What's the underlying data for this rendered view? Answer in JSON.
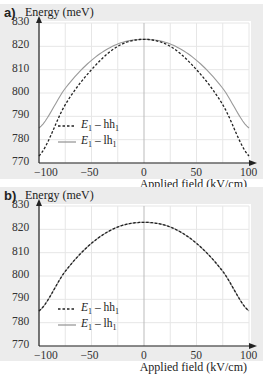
{
  "chart_data": [
    {
      "panel": "a)",
      "type": "line",
      "title": "",
      "ylabel": "Energy (meV)",
      "xlabel": "Applied field (kV/cm)",
      "xlim": [
        -100,
        100
      ],
      "ylim": [
        770,
        830
      ],
      "xticks": [
        "-100",
        "-50",
        "0",
        "50",
        "100"
      ],
      "yticks": [
        "830",
        "820",
        "810",
        "800",
        "790",
        "780",
        "770"
      ],
      "grid": true,
      "legend_position": "lower-left inside",
      "x": [
        -100,
        -75,
        -50,
        -25,
        0,
        25,
        50,
        75,
        100
      ],
      "series": [
        {
          "name": "E1 – hh1",
          "style": "dashed",
          "color": "#222222",
          "values": [
            773,
            795,
            810,
            820,
            823,
            820,
            810,
            795,
            773
          ]
        },
        {
          "name": "E1 – lh1",
          "style": "solid",
          "color": "#999999",
          "values": [
            785,
            802,
            814,
            821,
            823,
            821,
            814,
            802,
            785
          ]
        }
      ]
    },
    {
      "panel": "b)",
      "type": "line",
      "title": "",
      "ylabel": "Energy (meV)",
      "xlabel": "Applied field (kV/cm)",
      "xlim": [
        -100,
        100
      ],
      "ylim": [
        770,
        830
      ],
      "xticks": [
        "-100",
        "-50",
        "0",
        "50",
        "100"
      ],
      "yticks": [
        "830",
        "820",
        "810",
        "800",
        "790",
        "780",
        "770"
      ],
      "grid": true,
      "legend_position": "lower-left inside",
      "x": [
        -100,
        -75,
        -50,
        -25,
        0,
        25,
        50,
        75,
        100
      ],
      "series": [
        {
          "name": "E1 – hh1",
          "style": "dashed",
          "color": "#222222",
          "values": [
            785,
            802,
            814,
            821,
            823,
            821,
            814,
            802,
            785
          ]
        },
        {
          "name": "E1 – lh1",
          "style": "solid",
          "color": "#999999",
          "values": [
            785,
            802,
            814,
            821,
            823,
            821,
            814,
            802,
            785
          ]
        }
      ]
    }
  ],
  "panels": [
    {
      "label": "a)",
      "ylabel": "Energy (meV)",
      "xlabel": "Applied field (kV/cm)",
      "legend": [
        {
          "prefix": "E",
          "sub1": "1",
          "mid": " – hh",
          "sub2": "1"
        },
        {
          "prefix": "E",
          "sub1": "1",
          "mid": " – lh",
          "sub2": "1"
        }
      ]
    },
    {
      "label": "b)",
      "ylabel": "Energy (meV)",
      "xlabel": "Applied field (kV/cm)",
      "legend": [
        {
          "prefix": "E",
          "sub1": "1",
          "mid": " – hh",
          "sub2": "1"
        },
        {
          "prefix": "E",
          "sub1": "1",
          "mid": " – lh",
          "sub2": "1"
        }
      ]
    }
  ],
  "colors": {
    "panel_bg": "#ececec",
    "plot_bg": "#ffffff",
    "grid": "#e6e6e6",
    "axis": "#222222",
    "dashed_series": "#222222",
    "solid_series": "#999999"
  }
}
